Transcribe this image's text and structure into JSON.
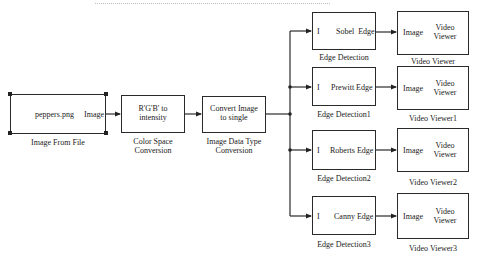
{
  "diagram": {
    "type": "simulink-block-diagram",
    "blocks": {
      "image_from_file": {
        "content": "peppers.png",
        "port_out": "Image",
        "caption": "Image From File"
      },
      "color_space": {
        "content_line1": "R'G'B' to",
        "content_line2": "intensity",
        "caption_line1": "Color Space",
        "caption_line2": "Conversion"
      },
      "data_type": {
        "content_line1": "Convert Image",
        "content_line2": "to single",
        "caption_line1": "Image Data Type",
        "caption_line2": "Conversion"
      },
      "edge0": {
        "port_in": "I",
        "port_out": "Sobel  Edge",
        "caption": "Edge Detection"
      },
      "edge1": {
        "port_in": "I",
        "port_out": "Prewitt Edge",
        "caption": "Edge Detection1"
      },
      "edge2": {
        "port_in": "I",
        "port_out": "Roberts Edge",
        "caption": "Edge Detection2"
      },
      "edge3": {
        "port_in": "I",
        "port_out": "Canny Edge",
        "caption": "Edge Detection3"
      },
      "viewer0": {
        "port_in": "Image",
        "title_line1": "Video",
        "title_line2": "Viewer",
        "caption": "Video Viewer"
      },
      "viewer1": {
        "port_in": "Image",
        "title_line1": "Video",
        "title_line2": "Viewer",
        "caption": "Video Viewer1"
      },
      "viewer2": {
        "port_in": "Image",
        "title_line1": "Video",
        "title_line2": "Viewer",
        "caption": "Video Viewer2"
      },
      "viewer3": {
        "port_in": "Image",
        "title_line1": "Video",
        "title_line2": "Viewer",
        "caption": "Video Viewer3"
      }
    },
    "connections": [
      [
        "Image From File",
        "Color Space Conversion"
      ],
      [
        "Color Space Conversion",
        "Image Data Type Conversion"
      ],
      [
        "Image Data Type Conversion",
        "Edge Detection"
      ],
      [
        "Image Data Type Conversion",
        "Edge Detection1"
      ],
      [
        "Image Data Type Conversion",
        "Edge Detection2"
      ],
      [
        "Image Data Type Conversion",
        "Edge Detection3"
      ],
      [
        "Edge Detection",
        "Video Viewer"
      ],
      [
        "Edge Detection1",
        "Video Viewer1"
      ],
      [
        "Edge Detection2",
        "Video Viewer2"
      ],
      [
        "Edge Detection3",
        "Video Viewer3"
      ]
    ],
    "colors": {
      "line": "#2a2a2a",
      "background": "#ffffff"
    }
  }
}
